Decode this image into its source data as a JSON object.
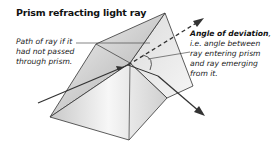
{
  "title": "Prism refracting light ray",
  "labels": {
    "path_of_ray": "Path of ray if it had not passed through prism.",
    "angle_heading": "Angle of deviation",
    "angle_suffix": ",",
    "angle_text": "i.e. angle between ray entering prism and ray emerging from it."
  },
  "colors": {
    "prism_edge": "#333333",
    "ray": "#333333",
    "prism_face_light": "#f2f2f2",
    "prism_face_dark": "#bdbdbd"
  }
}
